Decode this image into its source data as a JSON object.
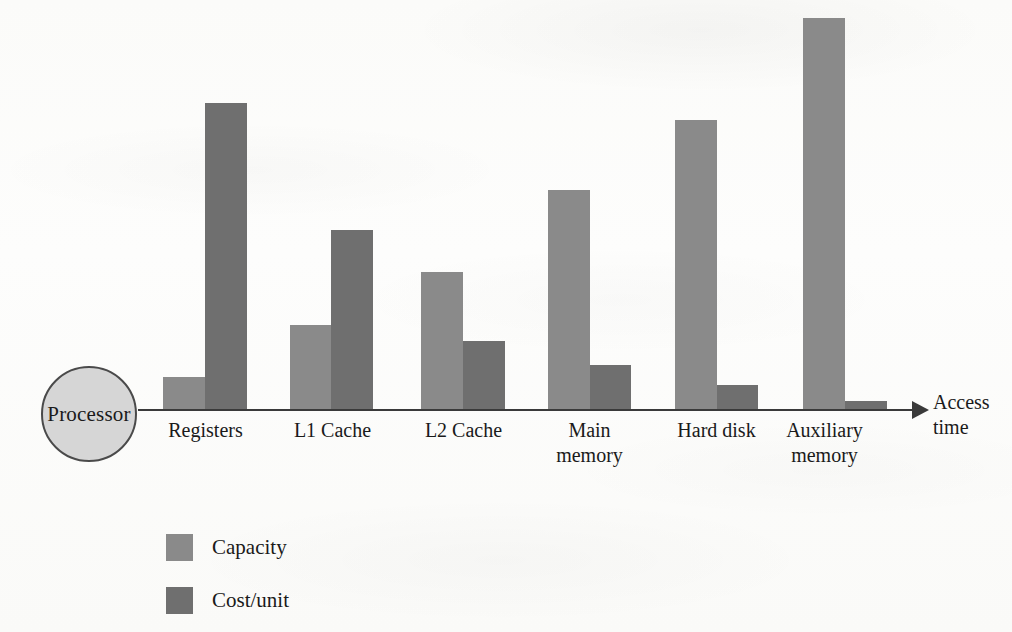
{
  "chart_data": {
    "type": "bar",
    "title": "",
    "subtitle": "",
    "xlabel": "Access time",
    "ylabel": "",
    "categories": [
      "Registers",
      "L1 Cache",
      "L2 Cache",
      "Main\nmemory",
      "Hard disk",
      "Auxiliary\nmemory"
    ],
    "series": [
      {
        "name": "Capacity",
        "color": "#8a8a8a",
        "values": [
          12,
          28,
          45,
          72,
          94,
          128
        ]
      },
      {
        "name": "Cost/unit",
        "color": "#6f6f6f",
        "values": [
          122,
          90,
          27,
          14,
          7,
          2
        ]
      }
    ],
    "ylim": [
      0,
      132
    ],
    "grid": false,
    "legend_position": "bottom-left",
    "annotations": [
      {
        "name": "processor-node",
        "text": "Processor",
        "shape": "circle"
      },
      {
        "name": "axis-arrow",
        "text": "",
        "shape": "arrow-right"
      }
    ]
  },
  "bars": [
    {
      "category": "Registers",
      "series": "Capacity",
      "left": 163,
      "width": 42,
      "height": 33
    },
    {
      "category": "Registers",
      "series": "Cost/unit",
      "left": 205,
      "width": 42,
      "height": 307
    },
    {
      "category": "L1 Cache",
      "series": "Capacity",
      "left": 290,
      "width": 41,
      "height": 85
    },
    {
      "category": "L1 Cache",
      "series": "Cost/unit",
      "left": 331,
      "width": 42,
      "height": 180
    },
    {
      "category": "L2 Cache",
      "series": "Capacity",
      "left": 421,
      "width": 42,
      "height": 138
    },
    {
      "category": "L2 Cache",
      "series": "Cost/unit",
      "left": 463,
      "width": 42,
      "height": 69
    },
    {
      "category": "Main memory",
      "series": "Capacity",
      "left": 548,
      "width": 42,
      "height": 220
    },
    {
      "category": "Main memory",
      "series": "Cost/unit",
      "left": 590,
      "width": 41,
      "height": 45
    },
    {
      "category": "Hard disk",
      "series": "Capacity",
      "left": 675,
      "width": 42,
      "height": 290
    },
    {
      "category": "Hard disk",
      "series": "Cost/unit",
      "left": 717,
      "width": 41,
      "height": 25
    },
    {
      "category": "Auxiliary memory",
      "series": "Capacity",
      "left": 803,
      "width": 42,
      "height": 392
    },
    {
      "category": "Auxiliary memory",
      "series": "Cost/unit",
      "left": 845,
      "width": 42,
      "height": 9
    }
  ],
  "category_labels": [
    {
      "text": "Registers",
      "left": 143,
      "width": 125
    },
    {
      "text": "L1 Cache",
      "left": 270,
      "width": 125
    },
    {
      "text": "L2 Cache",
      "left": 401,
      "width": 125
    },
    {
      "text": "Main\nmemory",
      "left": 527,
      "width": 125
    },
    {
      "text": "Hard disk",
      "left": 654,
      "width": 125
    },
    {
      "text": "Auxiliary\nmemory",
      "left": 762,
      "width": 125
    }
  ],
  "processor": {
    "label": "Processor",
    "fill": "#d6d6d6",
    "stroke": "#4a4a4a"
  },
  "axis": {
    "title": "Access\ntime",
    "color": "#3a3a3a"
  },
  "legend": {
    "items": [
      {
        "label": "Capacity",
        "color": "#8a8a8a"
      },
      {
        "label": "Cost/unit",
        "color": "#6f6f6f"
      }
    ]
  }
}
